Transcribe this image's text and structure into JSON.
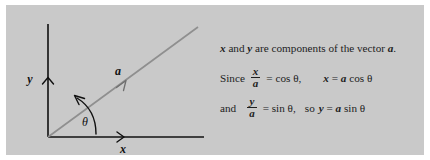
{
  "figure": {
    "kind": "vector-components-diagram",
    "panel_bg": "#c9c9c9",
    "page_bg": "#ffffff",
    "ink_color": "#101010",
    "vector_color": "#8a8a8a"
  },
  "diagram": {
    "y_axis_label": "y",
    "x_axis_label": "x",
    "vector_label": "a",
    "angle_label": "θ",
    "origin": {
      "x": 42,
      "y": 132
    },
    "y_axis_top": {
      "x": 42,
      "y": 19
    },
    "x_axis_end": {
      "x": 198,
      "y": 132
    },
    "vector_end": {
      "x": 192,
      "y": 22
    }
  },
  "text": {
    "line1": {
      "part_a": "x",
      "part_b": " and ",
      "part_c": "y",
      "part_d": " are components of the vector ",
      "part_e": "a",
      "part_f": "."
    },
    "line2": {
      "since": "Since",
      "frac_num": "x",
      "frac_den": "a",
      "equals_cos": "= cos θ,",
      "result": "x = a cos θ",
      "result_lhs": "x",
      "result_eq": " = ",
      "result_vec": "a",
      "result_fn": " cos θ"
    },
    "line3": {
      "and": "and",
      "frac_num": "y",
      "frac_den": "a",
      "equals_sin": "= sin θ,",
      "so": "so",
      "result_lhs": "y",
      "result_eq": " = ",
      "result_vec": "a",
      "result_fn": " sin θ"
    }
  }
}
